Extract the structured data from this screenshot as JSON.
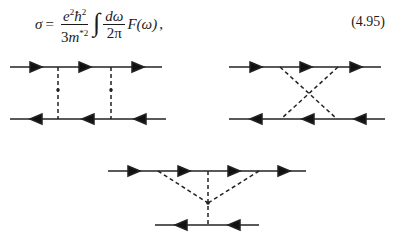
{
  "equation": {
    "lhs": "σ",
    "equals": "=",
    "frac1": {
      "num_e": "e",
      "num_e_exp": "2",
      "num_hbar": "ħ",
      "num_hbar_exp": "2",
      "den_coef": "3",
      "den_m": "m",
      "den_exp": "*2"
    },
    "integral": "∫",
    "frac2": {
      "num": "dω",
      "den": "2π"
    },
    "func": "F(ω)",
    "trailing": ",",
    "number": "(4.95)"
  },
  "diagrams": [
    {
      "name": "ladder-diagram",
      "description": "Two fermion lines (top rightward, bottom leftward) connected by two vertical dashed interaction lines"
    },
    {
      "name": "crossed-diagram",
      "description": "Two fermion lines connected by two crossed dashed interaction lines"
    },
    {
      "name": "vertex-diagram",
      "description": "Top fermion line with two dashed lines joining at a vertex connected by a dashed line to bottom fermion line"
    }
  ]
}
